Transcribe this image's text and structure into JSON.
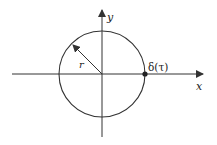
{
  "diagram": {
    "colors": {
      "stroke": "#333333",
      "text": "#222222",
      "background": "#ffffff"
    },
    "labels": {
      "x_axis": "x",
      "y_axis": "y",
      "radius": "r",
      "point": "δ(τ)"
    },
    "geometry": {
      "center": [
        102,
        74
      ],
      "radius": 43,
      "x_axis": {
        "from": [
          12,
          74
        ],
        "to": [
          205,
          74
        ]
      },
      "y_axis": {
        "from": [
          102,
          137
        ],
        "to": [
          102,
          8
        ]
      },
      "radius_arrow": {
        "from": [
          102,
          74
        ],
        "to": [
          72,
          44
        ]
      },
      "point": [
        145,
        74
      ]
    }
  }
}
